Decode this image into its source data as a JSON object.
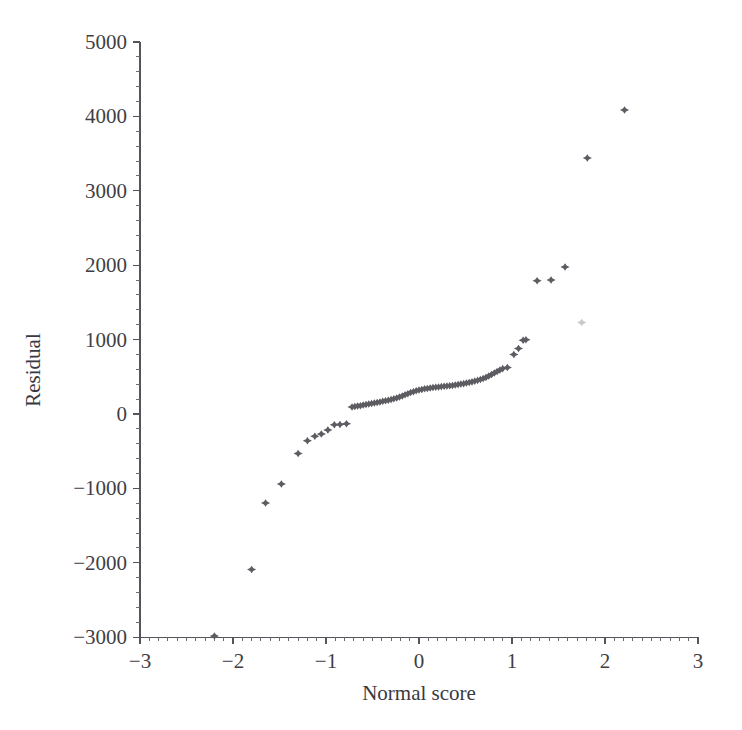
{
  "figure": {
    "background_color": "#ffffff",
    "marker_color": "#5d5c62",
    "axis_color": "#55545a",
    "faint_marker_color": "#c9c8cd"
  },
  "chart_data": {
    "type": "scatter",
    "title": "",
    "subtitle": "",
    "xlabel": "Normal score",
    "ylabel": "Residual",
    "xlim": [
      -3,
      3
    ],
    "ylim": [
      -3000,
      5000
    ],
    "xticks": [
      -3,
      -2,
      -1,
      0,
      1,
      2,
      3
    ],
    "xtick_labels": [
      "−3",
      "−2",
      "−1",
      "0",
      "1",
      "2",
      "3"
    ],
    "yticks": [
      -3000,
      -2000,
      -1000,
      0,
      1000,
      2000,
      3000,
      4000,
      5000
    ],
    "ytick_labels": [
      "−3000",
      "−2000",
      "−1000",
      "0",
      "1000",
      "2000",
      "3000",
      "4000",
      "5000"
    ],
    "x_minor_tick_step": 0.1,
    "y_minor_tick_step": 200,
    "grid": false,
    "legend": null,
    "annotations": [],
    "marker_style": "star",
    "series": [
      {
        "name": "Residual vs normal score",
        "points": [
          [
            -2.2,
            -2985
          ],
          [
            -1.8,
            -2090
          ],
          [
            -1.65,
            -1195
          ],
          [
            -1.48,
            -940
          ],
          [
            -1.3,
            -530
          ],
          [
            -1.2,
            -360
          ],
          [
            -1.12,
            -300
          ],
          [
            -1.05,
            -270
          ],
          [
            -0.98,
            -215
          ],
          [
            -0.91,
            -145
          ],
          [
            -0.85,
            -140
          ],
          [
            -0.78,
            -130
          ],
          [
            -0.72,
            95
          ],
          [
            -0.69,
            100
          ],
          [
            -0.66,
            108
          ],
          [
            -0.63,
            112
          ],
          [
            -0.6,
            120
          ],
          [
            -0.57,
            128
          ],
          [
            -0.54,
            135
          ],
          [
            -0.51,
            140
          ],
          [
            -0.48,
            148
          ],
          [
            -0.45,
            155
          ],
          [
            -0.42,
            162
          ],
          [
            -0.39,
            170
          ],
          [
            -0.36,
            178
          ],
          [
            -0.33,
            185
          ],
          [
            -0.3,
            195
          ],
          [
            -0.27,
            205
          ],
          [
            -0.24,
            215
          ],
          [
            -0.21,
            228
          ],
          [
            -0.18,
            242
          ],
          [
            -0.15,
            258
          ],
          [
            -0.12,
            272
          ],
          [
            -0.09,
            288
          ],
          [
            -0.06,
            300
          ],
          [
            -0.03,
            312
          ],
          [
            0.0,
            322
          ],
          [
            0.03,
            330
          ],
          [
            0.06,
            338
          ],
          [
            0.09,
            344
          ],
          [
            0.12,
            350
          ],
          [
            0.15,
            355
          ],
          [
            0.18,
            360
          ],
          [
            0.21,
            364
          ],
          [
            0.24,
            368
          ],
          [
            0.27,
            372
          ],
          [
            0.3,
            376
          ],
          [
            0.33,
            380
          ],
          [
            0.36,
            384
          ],
          [
            0.39,
            390
          ],
          [
            0.42,
            396
          ],
          [
            0.45,
            402
          ],
          [
            0.48,
            408
          ],
          [
            0.51,
            416
          ],
          [
            0.54,
            424
          ],
          [
            0.57,
            432
          ],
          [
            0.6,
            442
          ],
          [
            0.63,
            452
          ],
          [
            0.66,
            464
          ],
          [
            0.69,
            478
          ],
          [
            0.72,
            492
          ],
          [
            0.75,
            510
          ],
          [
            0.78,
            530
          ],
          [
            0.81,
            550
          ],
          [
            0.84,
            570
          ],
          [
            0.87,
            592
          ],
          [
            0.9,
            610
          ],
          [
            0.95,
            625
          ],
          [
            1.02,
            800
          ],
          [
            1.07,
            880
          ],
          [
            1.12,
            990
          ],
          [
            1.15,
            998
          ],
          [
            1.27,
            1790
          ],
          [
            1.42,
            1800
          ],
          [
            1.57,
            1975
          ],
          [
            1.81,
            3440
          ],
          [
            2.21,
            4085
          ]
        ]
      },
      {
        "name": "faint artifact mark",
        "faint": true,
        "points": [
          [
            1.75,
            1230
          ]
        ]
      }
    ]
  }
}
